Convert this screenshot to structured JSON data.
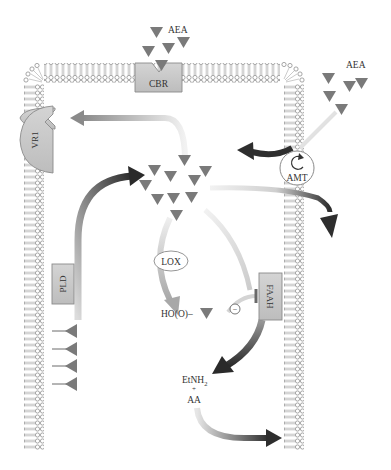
{
  "diagram": {
    "type": "endocannabinoid-signaling-pathway",
    "colors": {
      "membrane": "#9a9a9a",
      "protein_fill": "#c8c8c8",
      "protein_stroke": "#8a8a8a",
      "ligand": "#7a7a7a",
      "arrow_dark": "#2e2e2e",
      "arrow_light": "#d8d8d8"
    },
    "labels": {
      "aea_top": "AEA",
      "aea_right": "AEA",
      "cbr": "CBR",
      "vr1": "VR1",
      "amt": "AMT",
      "pld": "PLD",
      "lox": "LOX",
      "faah": "FAAH",
      "ho_o": "HO(O)–",
      "inhibit_sign": "−",
      "etnh2": "EtNH",
      "etnh2_sub": "2",
      "plus": "+",
      "aa": "AA"
    },
    "nodes": [
      {
        "id": "cbr",
        "label": "CBR",
        "kind": "receptor",
        "location": "top membrane"
      },
      {
        "id": "vr1",
        "label": "VR1",
        "kind": "receptor",
        "location": "left membrane"
      },
      {
        "id": "amt",
        "label": "AMT",
        "kind": "transporter",
        "location": "right membrane"
      },
      {
        "id": "pld",
        "label": "PLD",
        "kind": "enzyme",
        "location": "left membrane inner"
      },
      {
        "id": "lox",
        "label": "LOX",
        "kind": "enzyme",
        "location": "cytosol"
      },
      {
        "id": "faah",
        "label": "FAAH",
        "kind": "enzyme",
        "location": "right membrane inner"
      }
    ],
    "edges": [
      {
        "from": "pld",
        "to": "aea-pool",
        "style": "gradient-dark"
      },
      {
        "from": "aea-pool",
        "to": "vr1",
        "style": "gradient-light"
      },
      {
        "from": "aea-pool",
        "to": "lox",
        "style": "gradient-light"
      },
      {
        "from": "lox",
        "to": "ho(o)-aea",
        "style": "gradient-light"
      },
      {
        "from": "ho(o)-aea",
        "to": "faah",
        "style": "inhibition"
      },
      {
        "from": "aea-pool",
        "to": "faah",
        "style": "gradient-dark"
      },
      {
        "from": "faah",
        "to": "etnh2+aa",
        "style": "gradient-dark"
      },
      {
        "from": "etnh2+aa",
        "to": "membrane-out",
        "style": "gradient-dark"
      },
      {
        "from": "aea-extracellular",
        "to": "amt",
        "style": "gradient-light"
      },
      {
        "from": "amt",
        "to": "cytosol",
        "style": "dark"
      },
      {
        "from": "aea-pool",
        "to": "amt-out",
        "style": "gradient-dark"
      }
    ]
  }
}
